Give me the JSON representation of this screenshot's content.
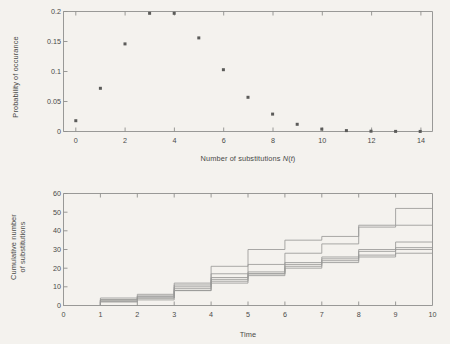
{
  "figure": {
    "background_color": "#f4f2ee",
    "axis_color": "#8f8f8c",
    "marker_color": "#5b5b59",
    "line_color": "#9a9a97",
    "text_color": "#4a4a48"
  },
  "panels": {
    "top": {
      "ylabel": "Probability of occurance",
      "xlabel_prefix": "Number of substitutions ",
      "xlabel_math_n": "N",
      "xlabel_paren_open": "(",
      "xlabel_math_t": "t",
      "xlabel_paren_close": ")",
      "xticks": [
        "0",
        "2",
        "4",
        "6",
        "8",
        "10",
        "12",
        "14"
      ],
      "yticks": [
        "0",
        "0.05",
        "0.1",
        "0.15",
        "0.2"
      ]
    },
    "bottom": {
      "ylabel_line1": "Cumulative number",
      "ylabel_line2": "of substitutions",
      "xlabel": "Time",
      "xticks": [
        "0",
        "1",
        "2",
        "3",
        "4",
        "5",
        "6",
        "7",
        "8",
        "9",
        "10"
      ],
      "yticks": [
        "0",
        "10",
        "20",
        "30",
        "40",
        "50",
        "60"
      ]
    }
  },
  "chart_data": [
    {
      "type": "scatter",
      "title": "",
      "xlabel": "Number of substitutions N(t)",
      "ylabel": "Probability of occurance",
      "xlim": [
        -0.5,
        14.5
      ],
      "ylim": [
        0,
        0.2
      ],
      "xticks": [
        0,
        2,
        4,
        6,
        8,
        10,
        12,
        14
      ],
      "yticks": [
        0,
        0.05,
        0.1,
        0.15,
        0.2
      ],
      "grid": false,
      "legend": "none",
      "marker": "square-dot",
      "x": [
        0,
        1,
        2,
        3,
        4,
        5,
        6,
        7,
        8,
        9,
        10,
        11,
        12,
        13,
        14
      ],
      "values": [
        0.018,
        0.072,
        0.146,
        0.197,
        0.197,
        0.156,
        0.103,
        0.057,
        0.029,
        0.012,
        0.004,
        0.0015,
        0.0005,
        0.0002,
        0.0001
      ],
      "note_clipped": "points at x=3 and x=4 are clipped at the ylim top 0.2"
    },
    {
      "type": "line",
      "title": "",
      "xlabel": "Time",
      "ylabel": "Cumulative number of substitutions",
      "xlim": [
        0,
        10
      ],
      "ylim": [
        0,
        60
      ],
      "xticks": [
        0,
        1,
        2,
        3,
        4,
        5,
        6,
        7,
        8,
        9,
        10
      ],
      "yticks": [
        0,
        10,
        20,
        30,
        40,
        50,
        60
      ],
      "grid": false,
      "legend": "none",
      "drawstyle": "steps-post",
      "x": [
        0,
        1,
        2,
        3,
        4,
        5,
        6,
        7,
        8,
        9,
        10
      ],
      "series": [
        {
          "name": "trajectory-1",
          "values": [
            0,
            4,
            6,
            12,
            21,
            30,
            35,
            37,
            43,
            52,
            52
          ]
        },
        {
          "name": "trajectory-2",
          "values": [
            0,
            3,
            5,
            11,
            17,
            22,
            28,
            33,
            42,
            43,
            43
          ]
        },
        {
          "name": "trajectory-3",
          "values": [
            0,
            3,
            5,
            10,
            15,
            18,
            23,
            26,
            30,
            34,
            34
          ]
        },
        {
          "name": "trajectory-4",
          "values": [
            0,
            3,
            4,
            9,
            14,
            17,
            22,
            25,
            29,
            31,
            31
          ]
        },
        {
          "name": "trajectory-5",
          "values": [
            0,
            2,
            4,
            8,
            13,
            17,
            21,
            24,
            27,
            30,
            30
          ]
        },
        {
          "name": "trajectory-6",
          "values": [
            0,
            2,
            3,
            8,
            12,
            16,
            20,
            23,
            26,
            28,
            28
          ]
        }
      ]
    }
  ]
}
